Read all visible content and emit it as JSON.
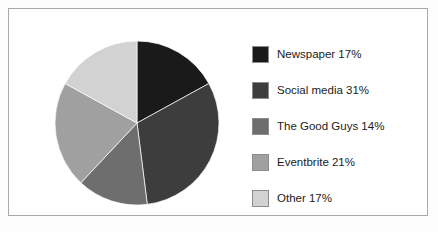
{
  "chart_data": {
    "type": "pie",
    "title": "",
    "categories": [
      "Newspaper",
      "Social media",
      "The Good Guys",
      "Eventbrite",
      "Other"
    ],
    "values": [
      17,
      31,
      14,
      21,
      17
    ],
    "value_unit": "%",
    "slice_colors": [
      "#1a1a1a",
      "#3d3d3d",
      "#6e6e6e",
      "#a0a0a0",
      "#d2d2d2"
    ],
    "start_angle_deg": 0,
    "direction": "clockwise",
    "legend_position": "right",
    "grid": false,
    "labels": [
      "Newspaper 17%",
      "Social media 31%",
      "The Good Guys 14%",
      "Eventbrite 21%",
      "Other 17%"
    ]
  },
  "frame": {
    "border_color": "#a8a8a8",
    "background": "#ffffff"
  },
  "legend": {
    "items": [
      {
        "label": "Newspaper 17%",
        "name": "Newspaper",
        "value": 17,
        "color": "#1a1a1a"
      },
      {
        "label": "Social media 31%",
        "name": "Social media",
        "value": 31,
        "color": "#3d3d3d"
      },
      {
        "label": "The Good Guys 14%",
        "name": "The Good Guys",
        "value": 14,
        "color": "#6e6e6e"
      },
      {
        "label": "Eventbrite 21%",
        "name": "Eventbrite",
        "value": 21,
        "color": "#a0a0a0"
      },
      {
        "label": "Other 17%",
        "name": "Other",
        "value": 17,
        "color": "#d2d2d2"
      }
    ]
  }
}
